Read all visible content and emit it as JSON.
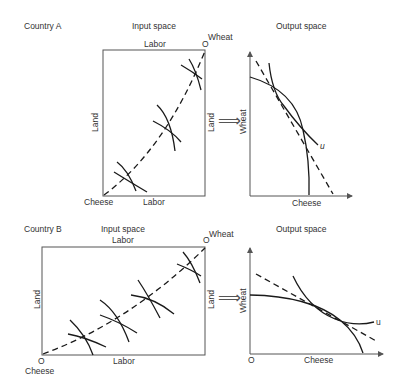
{
  "panels": [
    {
      "country": "Country A",
      "input_space": {
        "title": "Input space",
        "top_label": "Labor",
        "bottom_label": "Labor",
        "left_label": "Land",
        "right_label": "Land",
        "origin_top_right": "O",
        "top_right_good": "Wheat",
        "bottom_left_good": "Cheese"
      },
      "output_space": {
        "title": "Output space",
        "y_label": "Wheat",
        "x_label": "Cheese",
        "curve_label": "u"
      }
    },
    {
      "country": "Country B",
      "input_space": {
        "title": "Input space",
        "top_label": "Labor",
        "bottom_label": "Labor",
        "left_label": "Land",
        "right_label": "Land",
        "origin_top_right": "O",
        "top_right_good": "Wheat",
        "origin_bottom_left": "O",
        "bottom_left_good": "Cheese"
      },
      "output_space": {
        "title": "Output space",
        "y_label": "Wheat",
        "x_label": "Cheese",
        "origin": "O",
        "curve_label": "u"
      }
    }
  ],
  "arrow_symbol": "⟹",
  "colors": {
    "line": "#1a1a1a",
    "frame": "#555555",
    "text": "#333333"
  }
}
